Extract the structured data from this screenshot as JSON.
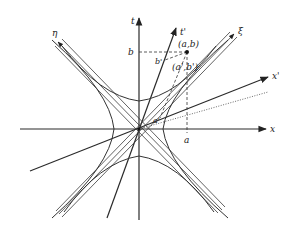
{
  "diagram": {
    "labels": {
      "x_axis": "x",
      "t_axis": "t",
      "x_prime_axis": "x'",
      "t_prime_axis": "t'",
      "xi": "ξ",
      "eta": "η",
      "point": "(a,b)",
      "point_prime": "(a',b')",
      "a_tick": "a",
      "b_tick": "b",
      "a_prime_tick": "a'",
      "b_prime_tick": "b'"
    },
    "colors": {
      "line": "#2a2a2a",
      "background": "#ffffff"
    }
  }
}
